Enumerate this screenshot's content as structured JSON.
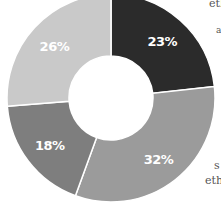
{
  "chart_data": {
    "type": "pie",
    "variant": "donut",
    "title": "",
    "categories": [
      "Segment A",
      "Segment B",
      "Segment C",
      "Segment D"
    ],
    "values": [
      23,
      32,
      18,
      26
    ],
    "labels": [
      "23%",
      "32%",
      "18%",
      "26%"
    ],
    "colors": [
      "#2b2b2b",
      "#9b9b9b",
      "#7e7e7e",
      "#c9c9c9"
    ],
    "start_angle_deg": 0,
    "direction": "clockwise",
    "legend": "none"
  },
  "edge_text": {
    "top_right": "eth",
    "upper_right": "a",
    "bottom_right_1": "s",
    "bottom_right_2": "eth"
  }
}
